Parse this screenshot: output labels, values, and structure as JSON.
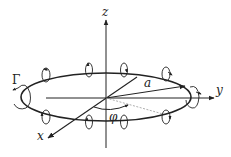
{
  "diagram": {
    "labels": {
      "z_axis": "z",
      "y_axis": "y",
      "x_axis": "x",
      "radius": "a",
      "angle": "φ",
      "circulation": "Γ"
    },
    "colors": {
      "stroke": "#222222",
      "dotted_line": "#999999",
      "background": "#ffffff"
    },
    "ring": {
      "cx": 106,
      "cy": 97,
      "rx": 85,
      "ry": 24
    },
    "swirl_markers": 10
  }
}
